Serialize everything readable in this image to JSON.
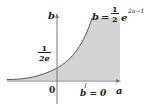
{
  "diagram": {
    "type": "function-region-plot",
    "colors": {
      "background": "#ffffff",
      "fill": "#d4d4d4",
      "curve": "#555555",
      "axis": "#777777",
      "text": "#222222"
    },
    "axes": {
      "x_label": "a",
      "y_label": "b",
      "origin_label": "0"
    },
    "curve_equation": {
      "lhs": "b",
      "equals": "=",
      "coef_num": "1",
      "coef_den": "2",
      "base": "e",
      "exponent": "2a−1"
    },
    "y_intercept": {
      "num": "1",
      "den": "2e"
    },
    "line_label": "b = 0"
  }
}
